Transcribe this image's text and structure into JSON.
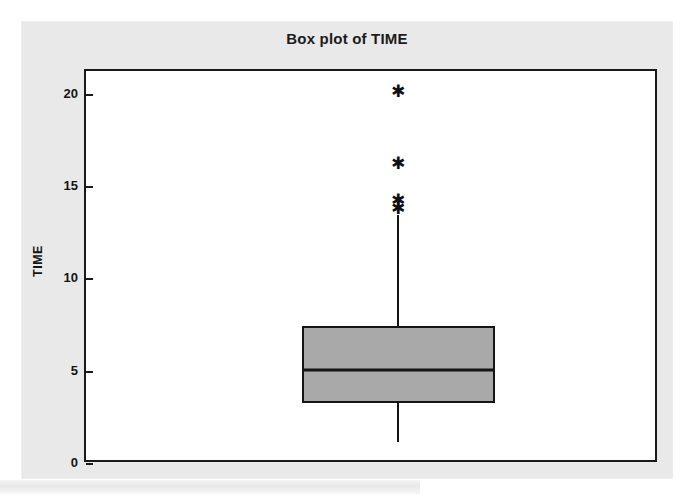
{
  "chart_data": {
    "type": "box",
    "title": "Box plot of TIME",
    "xlabel": "",
    "ylabel": "TIME",
    "ylim": [
      0,
      21.3
    ],
    "grid": false,
    "legend": "none",
    "y_ticks": [
      {
        "label": "0",
        "value": 0
      },
      {
        "label": "5",
        "value": 5
      },
      {
        "label": "10",
        "value": 10
      },
      {
        "label": "15",
        "value": 15
      },
      {
        "label": "20",
        "value": 20
      }
    ],
    "categories": [
      "TIME"
    ],
    "boxes": [
      {
        "name": "TIME",
        "whisker_low": 1.2,
        "q1": 3.3,
        "median": 5.1,
        "q3": 7.5,
        "whisker_high": 13.5,
        "outliers": [
          13.9,
          14.3,
          16.3,
          20.2
        ],
        "fill_color": "#a9a9a9",
        "line_color": "#151515"
      }
    ],
    "colors": {
      "panel_background": "#e9e9e9",
      "plot_background": "#ffffff",
      "axis": "#1a1a1a",
      "text": "#141414",
      "box_fill": "#a9a9a9"
    }
  },
  "icons": {
    "outlier": "outlier-asterisk-icon"
  },
  "markers": {
    "outlier_glyph": "✱"
  }
}
